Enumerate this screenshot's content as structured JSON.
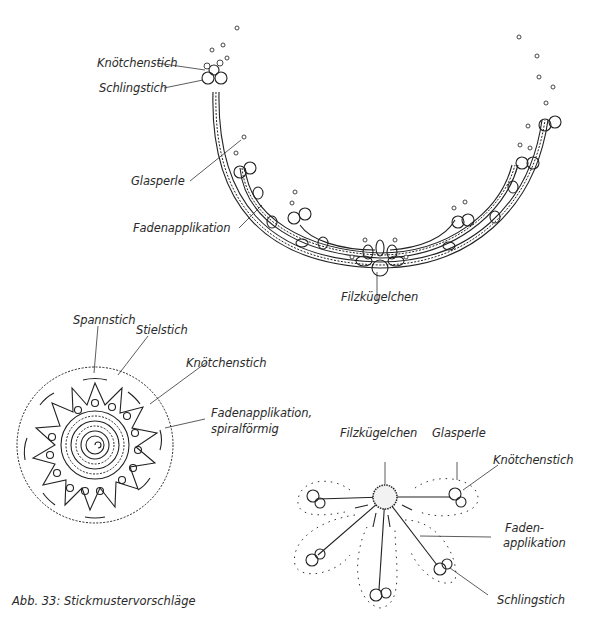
{
  "figure": {
    "caption": "Abb. 33: Stickmustervorschläge"
  },
  "top_motif": {
    "labels": {
      "knoetchenstich": "Knötchenstich",
      "schlingstich": "Schlingstich",
      "glasperle": "Glasperle",
      "fadenapplikation": "Fadenapplikation",
      "filzkuegelchen": "Filzkügelchen"
    }
  },
  "round_motif": {
    "labels": {
      "spannstich": "Spannstich",
      "stielstich": "Stielstich",
      "knoetchenstich": "Knötchenstich",
      "fadenapplikation_1": "Fadenapplikation,",
      "fadenapplikation_2": "spiralförmig"
    }
  },
  "flower_motif": {
    "labels": {
      "filzkuegelchen": "Filzkügelchen",
      "glasperle": "Glasperle",
      "knoetchenstich": "Knötchenstich",
      "faden_1": "Faden-",
      "faden_2": "applikation",
      "schlingstich": "Schlingstich"
    }
  }
}
